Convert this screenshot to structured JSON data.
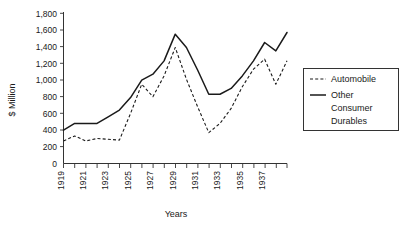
{
  "chart_data": {
    "type": "line",
    "title": "",
    "xlabel": "Years",
    "ylabel": "$ Million",
    "ylim": [
      0,
      1800
    ],
    "ytick_step": 200,
    "yticks": [
      "0",
      "200",
      "400",
      "600",
      "800",
      "1,000",
      "1,200",
      "1,400",
      "1,600",
      "1,800"
    ],
    "grid": false,
    "legend_position": "right",
    "x": [
      1919,
      1920,
      1921,
      1922,
      1923,
      1924,
      1925,
      1926,
      1927,
      1928,
      1929,
      1930,
      1931,
      1932,
      1933,
      1934,
      1935,
      1936,
      1937,
      1938,
      1939
    ],
    "xticks_labeled": [
      "1919",
      "",
      "1921",
      "",
      "1923",
      "",
      "1925",
      "",
      "1927",
      "",
      "1929",
      "",
      "1931",
      "",
      "1933",
      "",
      "1935",
      "",
      "1937",
      "",
      ""
    ],
    "xtick_labels_shown": [
      "1919",
      "1921",
      "1923",
      "1925",
      "1927",
      "1929",
      "1931",
      "1933",
      "1935",
      "1937"
    ],
    "series": [
      {
        "name": "Automobile",
        "style": "dashed",
        "color": "#1a1a1a",
        "values": [
          270,
          330,
          270,
          300,
          290,
          280,
          600,
          950,
          800,
          1050,
          1390,
          1010,
          680,
          370,
          480,
          660,
          920,
          1130,
          1250,
          950,
          1230
        ]
      },
      {
        "name": "Other Consumer Durables",
        "style": "solid",
        "color": "#1a1a1a",
        "values": [
          400,
          480,
          480,
          480,
          560,
          640,
          790,
          1000,
          1070,
          1230,
          1550,
          1390,
          1120,
          830,
          830,
          900,
          1050,
          1230,
          1450,
          1350,
          1570
        ]
      }
    ]
  },
  "legend": {
    "items": [
      {
        "label": "Automobile",
        "style": "dashed"
      },
      {
        "label": "Other",
        "style": "solid"
      },
      {
        "label": "Consumer",
        "style": "none"
      },
      {
        "label": "Durables",
        "style": "none"
      }
    ]
  }
}
